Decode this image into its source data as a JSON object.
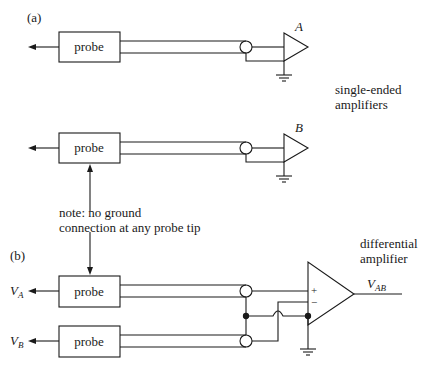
{
  "panel_a": {
    "label": "(a)",
    "probe_1": {
      "label": "probe"
    },
    "probe_2": {
      "label": "probe"
    },
    "amp_1": {
      "label": "A"
    },
    "amp_2": {
      "label": "B"
    },
    "caption_line1": "single-ended",
    "caption_line2": "amplifiers"
  },
  "note": {
    "line1": "note: no ground",
    "line2": "connection at any probe tip"
  },
  "panel_b": {
    "label": "(b)",
    "probe_1": {
      "label": "probe",
      "signal_main": "V",
      "signal_sub": "A"
    },
    "probe_2": {
      "label": "probe",
      "signal_main": "V",
      "signal_sub": "B"
    },
    "amp": {
      "caption_line1": "differential",
      "caption_line2": "amplifier",
      "plus": "+",
      "minus": "−",
      "output_main": "V",
      "output_sub": "AB"
    }
  }
}
